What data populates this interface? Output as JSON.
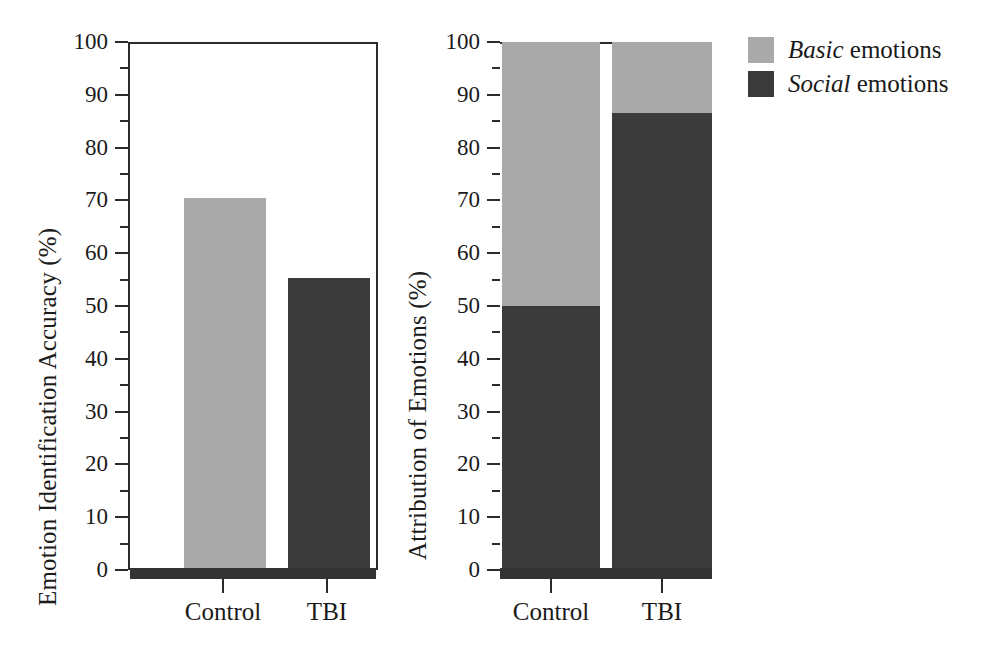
{
  "figure": {
    "background": "#ffffff",
    "colors": {
      "basic": "#a9a9a9",
      "social": "#3b3b3b",
      "axis": "#2b2b2b",
      "text": "#1a1a1a"
    }
  },
  "legend": {
    "position": "top-right",
    "items": [
      {
        "emphasis": "Basic",
        "rest": " emotions",
        "color": "#a9a9a9",
        "key": "basic"
      },
      {
        "emphasis": "Social",
        "rest": " emotions",
        "color": "#3b3b3b",
        "key": "social"
      }
    ]
  },
  "chart_data": [
    {
      "type": "bar",
      "panel": "left",
      "title": "",
      "xlabel": "",
      "ylabel": "Emotion Identification Accuracy (%)",
      "categories": [
        "Control",
        "TBI"
      ],
      "values": [
        70,
        55
      ],
      "colors": [
        "#a9a9a9",
        "#3b3b3b"
      ],
      "ylim": [
        0,
        100
      ],
      "yticks": [
        0,
        10,
        20,
        30,
        40,
        50,
        60,
        70,
        80,
        90,
        100
      ],
      "ytick_labels": [
        "0",
        "10",
        "20",
        "30",
        "40",
        "50",
        "60",
        "70",
        "80",
        "90",
        "100"
      ],
      "yminor_step": 5,
      "grid": false,
      "frame": "box"
    },
    {
      "type": "bar",
      "subtype": "stacked",
      "panel": "right",
      "title": "",
      "xlabel": "",
      "ylabel": "Attribution of Emotions (%)",
      "categories": [
        "Control",
        "TBI"
      ],
      "series": [
        {
          "name": "Social emotions",
          "values": [
            50,
            86.5
          ],
          "color": "#3b3b3b"
        },
        {
          "name": "Basic emotions",
          "values": [
            50,
            13.5
          ],
          "color": "#a9a9a9"
        }
      ],
      "ylim": [
        0,
        100
      ],
      "yticks": [
        0,
        10,
        20,
        30,
        40,
        50,
        60,
        70,
        80,
        90,
        100
      ],
      "ytick_labels": [
        "0",
        "10",
        "20",
        "30",
        "40",
        "50",
        "60",
        "70",
        "80",
        "90",
        "100"
      ],
      "yminor_step": 5,
      "grid": false,
      "frame": "top-only"
    }
  ]
}
